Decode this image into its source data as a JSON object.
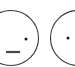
{
  "image": {
    "kind": "line-drawing",
    "subject": "two-partial-circular-faces",
    "width": 75,
    "height": 67,
    "background_color": "#ffffff",
    "stroke_color": "#3a3a3a",
    "feature_color": "#1a1a1a",
    "description": "Cropped sketch fragment showing two thin outlined circles resembling simple faces, both clipped by the image edges."
  },
  "shapes": [
    {
      "name": "left-face",
      "outline": {
        "center_x": 11,
        "center_y": 38,
        "radius": 27.5,
        "stroke_width": 1.1,
        "stroke_color": "#3a3a3a"
      },
      "features": [
        {
          "name": "left-face-eye-dot",
          "type": "dot",
          "cx": 26,
          "cy": 39,
          "r": 1.5,
          "color": "#1a1a1a"
        },
        {
          "name": "left-face-mouth-dash",
          "type": "dash",
          "x1": 6,
          "y1": 52,
          "x2": 20,
          "y2": 52,
          "stroke_width": 2.2,
          "color": "#4a4a4a"
        }
      ]
    },
    {
      "name": "right-face",
      "outline": {
        "center_x": 78,
        "center_y": 38,
        "radius": 27.5,
        "stroke_width": 1.1,
        "stroke_color": "#3a3a3a"
      },
      "features": [
        {
          "name": "right-face-eye-dot",
          "type": "dot",
          "cx": 68,
          "cy": 38,
          "r": 1.5,
          "color": "#1a1a1a"
        }
      ]
    }
  ]
}
